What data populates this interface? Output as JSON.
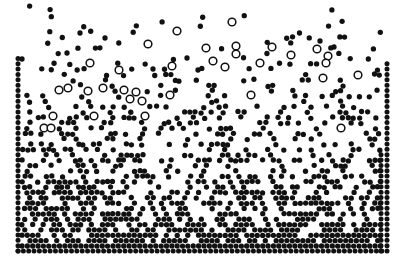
{
  "figure": {
    "description": "Two-dimensional molecular-dynamics snapshot of a vibrated granular bed: a dense crystalline packing near the bottom wall fluidizes into a dilute granular gas toward the top. Large open-circle intruder grains have segregated upward into the dilute region.",
    "background_color": "#ffffff",
    "width": 403,
    "height": 268
  },
  "domain_geometry": {
    "left_wall_x": 18,
    "right_wall_x": 387,
    "bottom_wall_y": 251,
    "top_y": 4,
    "interior_left": 22,
    "interior_right": 383,
    "interior_bottom": 246
  },
  "species": {
    "small": {
      "label": "small grain",
      "marker": "filled-circle",
      "color": "#111111",
      "diameter_px": 5.3,
      "count_approx": 1180
    },
    "large": {
      "label": "large intruder grain",
      "marker": "open-circle",
      "color": "#111111",
      "fill": "#ffffff",
      "diameter_px": 9.2,
      "stroke_px": 1.5,
      "count_approx": 42
    },
    "wall": {
      "label": "fixed wall grain",
      "marker": "filled-circle",
      "color": "#111111",
      "diameter_px": 5.0
    }
  },
  "chart_data": {
    "type": "scatter",
    "xlabel": "",
    "ylabel": "",
    "xlim": [
      0,
      403
    ],
    "ylim": [
      268,
      0
    ],
    "grid": false,
    "legend_position": "none",
    "axis_visible": false,
    "density_profile": {
      "note": "Number density decreases monotonically with height; packing fraction read from the snapshot at selected heights.",
      "height_px": [
        246,
        225,
        200,
        175,
        150,
        125,
        100,
        75,
        50,
        25
      ],
      "packing_fraction": [
        0.62,
        0.58,
        0.5,
        0.42,
        0.33,
        0.24,
        0.15,
        0.08,
        0.03,
        0.01
      ]
    },
    "generator": {
      "note": "Particle coordinates are produced deterministically from the seeded layout parameters below so that the rendered scatter reproduces the snapshot.",
      "seed": 20240517,
      "rows": 46,
      "row_spacing_px": 5.35,
      "base_column_spacing_px": 5.35,
      "bottom_row_y": 246,
      "jitter_gain_min": 0.06,
      "jitter_gain_max": 1.55,
      "fill_probability_bottom": 1.0,
      "fill_probability_top": 0.03,
      "density_exponent": 2.35,
      "large_particle_band_top_y": 14,
      "large_particle_band_bottom_y": 140,
      "large_particle_target_count": 42
    },
    "wall_layers": {
      "left_columns_x": [
        18
      ],
      "right_columns_x": [
        387,
        381
      ],
      "bottom_rows_y": [
        251
      ],
      "wall_spacing_px": 5.35
    },
    "large_particles": [
      {
        "x": 232,
        "y": 22
      },
      {
        "x": 177,
        "y": 31
      },
      {
        "x": 148,
        "y": 44
      },
      {
        "x": 206,
        "y": 48
      },
      {
        "x": 236,
        "y": 46
      },
      {
        "x": 272,
        "y": 47
      },
      {
        "x": 236,
        "y": 54
      },
      {
        "x": 291,
        "y": 55
      },
      {
        "x": 317,
        "y": 49
      },
      {
        "x": 90,
        "y": 63
      },
      {
        "x": 119,
        "y": 70
      },
      {
        "x": 172,
        "y": 66
      },
      {
        "x": 213,
        "y": 61
      },
      {
        "x": 225,
        "y": 67
      },
      {
        "x": 260,
        "y": 63
      },
      {
        "x": 328,
        "y": 56
      },
      {
        "x": 326,
        "y": 63
      },
      {
        "x": 323,
        "y": 78
      },
      {
        "x": 358,
        "y": 75
      },
      {
        "x": 59,
        "y": 90
      },
      {
        "x": 68,
        "y": 88
      },
      {
        "x": 88,
        "y": 91
      },
      {
        "x": 103,
        "y": 88
      },
      {
        "x": 124,
        "y": 90
      },
      {
        "x": 130,
        "y": 99
      },
      {
        "x": 136,
        "y": 92
      },
      {
        "x": 142,
        "y": 101
      },
      {
        "x": 170,
        "y": 95
      },
      {
        "x": 251,
        "y": 95
      },
      {
        "x": 53,
        "y": 116
      },
      {
        "x": 94,
        "y": 116
      },
      {
        "x": 145,
        "y": 116
      },
      {
        "x": 44,
        "y": 128
      },
      {
        "x": 51,
        "y": 128
      },
      {
        "x": 341,
        "y": 128
      }
    ],
    "stray_top_particles": [
      {
        "x": 80,
        "y": 33
      },
      {
        "x": 105,
        "y": 38
      },
      {
        "x": 67,
        "y": 53
      },
      {
        "x": 22,
        "y": 59
      },
      {
        "x": 320,
        "y": 41
      },
      {
        "x": 187,
        "y": 58
      },
      {
        "x": 153,
        "y": 69
      },
      {
        "x": 198,
        "y": 70
      }
    ]
  },
  "render_meta": {
    "canvas_name": "particle-scatter-canvas",
    "marker_edge_color": "#111111",
    "marker_face_color": "#111111",
    "open_marker_face_color": "#ffffff"
  }
}
